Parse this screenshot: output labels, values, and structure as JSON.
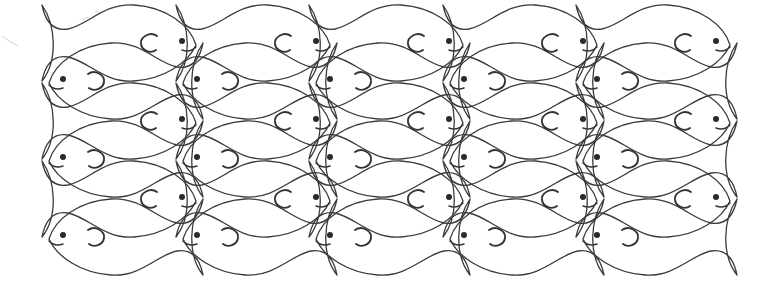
{
  "illustration": {
    "title": "Tessellated fish line drawing",
    "background": "#ffffff",
    "stroke_color": "#3a3a3a",
    "eye_color": "#2a2a2a",
    "columns": 5,
    "column_spacing": 133.5,
    "fish_length": 154,
    "fish_half_height": 39,
    "right_facing_rows": [
      {
        "row": 1,
        "y": 43,
        "head_x": [
          196,
          330,
          463,
          597,
          730
        ]
      },
      {
        "row": 2,
        "y": 121,
        "head_x": [
          196,
          330,
          463,
          597,
          730
        ]
      },
      {
        "row": 3,
        "y": 199,
        "head_x": [
          196,
          330,
          463,
          597,
          730
        ]
      }
    ],
    "left_facing_rows": [
      {
        "row": 1,
        "y": 81,
        "head_x": [
          49,
          183,
          316,
          450,
          583
        ]
      },
      {
        "row": 2,
        "y": 159,
        "head_x": [
          49,
          183,
          316,
          450,
          583
        ]
      },
      {
        "row": 3,
        "y": 237,
        "head_x": [
          49,
          183,
          316,
          450,
          583
        ]
      }
    ],
    "fish_count": 30
  }
}
